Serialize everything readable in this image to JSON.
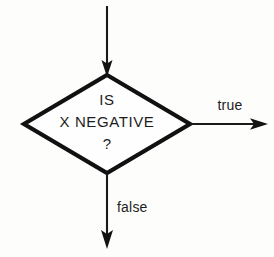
{
  "diagram": {
    "type": "flowchart",
    "background_color": "#fdfdfc",
    "stroke_color": "#111111",
    "text_color": "#1d1d1d",
    "decision_node": {
      "shape": "diamond",
      "lines": [
        "IS",
        "X NEGATIVE",
        "?"
      ],
      "line1": "IS",
      "line2": "X NEGATIVE",
      "line3": "?"
    },
    "edges": {
      "incoming": {
        "label": "",
        "direction": "down",
        "from": "top",
        "to": "decision"
      },
      "true_branch": {
        "label": "true",
        "direction": "right",
        "from": "decision",
        "to": "right-exit"
      },
      "false_branch": {
        "label": "false",
        "direction": "down",
        "from": "decision",
        "to": "bottom-exit"
      }
    }
  }
}
